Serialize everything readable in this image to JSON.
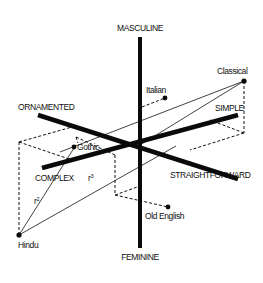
{
  "diagram": {
    "axes": {
      "top": "MASCULINE",
      "bottom": "FEMININE",
      "upper_left": "ORNAMENTED",
      "lower_right": "STRAIGHTFORWARD",
      "upper_right": "SIMPLE",
      "lower_left": "COMPLEX"
    },
    "points": {
      "classical": "Classical",
      "italian": "Italian",
      "gothic": "Gothic",
      "old_english": "Old English",
      "hindu": "Hindu"
    },
    "distance_labels": {
      "r2_base": "r",
      "r2_exp": "2",
      "r3_base": "r",
      "r3_exp": "3"
    },
    "colors": {
      "ink": "#0a0a0a",
      "background": "#ffffff"
    }
  }
}
